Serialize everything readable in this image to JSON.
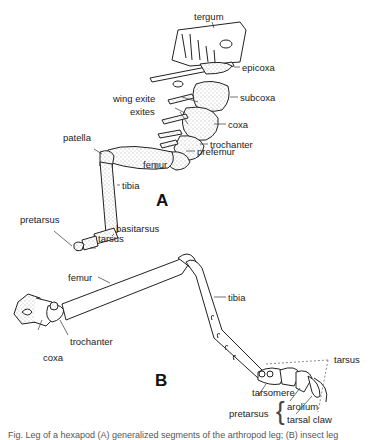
{
  "figure": {
    "panel_a": {
      "letter": "A",
      "labels": {
        "tergum": "tergum",
        "epicoxa": "epicoxa",
        "subcoxa": "subcoxa",
        "wing_exite": "wing exite",
        "exites": "exites",
        "coxa": "coxa",
        "trochanter": "trochanter",
        "prefemur": "prefemur",
        "patella": "patella",
        "femur": "femur",
        "tibia": "tibia",
        "pretarsus": "pretarsus",
        "basitarsus": "basitarsus",
        "tarsus": "tarsus"
      }
    },
    "panel_b": {
      "letter": "B",
      "labels": {
        "femur": "femur",
        "tibia": "tibia",
        "tarsus": "tarsus",
        "coxa": "coxa",
        "trochanter": "trochanter",
        "tarsomere": "tarsomere",
        "pretarsus": "pretarsus",
        "arolium": "arolium",
        "tarsal_claw": "tarsal claw",
        "brace": "{"
      }
    },
    "caption_fragment": "Fig. Leg of a hexapod (A) generalized segments of the arthropod leg; (B) insect leg"
  }
}
